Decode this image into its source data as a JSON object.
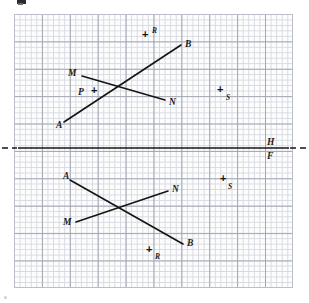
{
  "figure": {
    "background_color": "#ffffff",
    "grid_color": "#d3d7de",
    "grid_major_color": "#9aa0ad",
    "ink_color": "#141414",
    "width": 309,
    "height": 303
  },
  "grid": {
    "left": 14,
    "top": 14,
    "width": 279,
    "height": 274,
    "minor_cell_px": 5.58,
    "major_every": 5
  },
  "fold_line": {
    "name": "reference-line",
    "y": 148,
    "x_start": 18,
    "x_end": 289,
    "dash_left_x": 2,
    "dash_right_x": 307,
    "upper_label": "H",
    "lower_label": "F"
  },
  "top_view": {
    "name": "H-view",
    "lines": [
      {
        "name": "line-AB",
        "from_label": "A",
        "to_label": "B",
        "from": {
          "x": 64,
          "y": 122
        },
        "to": {
          "x": 181,
          "y": 45
        }
      },
      {
        "name": "line-MN",
        "from_label": "M",
        "to_label": "N",
        "from": {
          "x": 82,
          "y": 76
        },
        "to": {
          "x": 165,
          "y": 100
        }
      }
    ],
    "labels": [
      {
        "text": "A",
        "x": 56,
        "y": 121
      },
      {
        "text": "B",
        "x": 185,
        "y": 40
      },
      {
        "text": "M",
        "x": 68,
        "y": 69
      },
      {
        "text": "N",
        "x": 169,
        "y": 98
      }
    ],
    "points": [
      {
        "name": "point-P",
        "text": "P",
        "cross_x": 93,
        "cross_y": 87,
        "label_x": 78,
        "label_y": 88,
        "label_size": "lbl-lg"
      },
      {
        "name": "point-R",
        "text": "R",
        "cross_x": 144,
        "cross_y": 32,
        "label_x": 153,
        "label_y": 28,
        "label_size": "lbl-sm"
      },
      {
        "name": "point-S",
        "text": "S",
        "cross_x": 219,
        "cross_y": 88,
        "label_x": 227,
        "label_y": 95,
        "label_size": "lbl-sm"
      }
    ]
  },
  "bottom_view": {
    "name": "F-view",
    "lines": [
      {
        "name": "line-AB",
        "from_label": "A",
        "to_label": "B",
        "from": {
          "x": 70,
          "y": 180
        },
        "to": {
          "x": 183,
          "y": 244
        }
      },
      {
        "name": "line-MN",
        "from_label": "M",
        "to_label": "N",
        "from": {
          "x": 76,
          "y": 222
        },
        "to": {
          "x": 168,
          "y": 191
        }
      }
    ],
    "labels": [
      {
        "text": "A",
        "x": 64,
        "y": 173
      },
      {
        "text": "B",
        "x": 186,
        "y": 240
      },
      {
        "text": "M",
        "x": 64,
        "y": 219
      },
      {
        "text": "N",
        "x": 172,
        "y": 186
      }
    ],
    "points": [
      {
        "name": "point-R",
        "text": "R",
        "cross_x": 148,
        "cross_y": 247,
        "label_x": 155,
        "label_y": 254,
        "label_size": "lbl-sm"
      },
      {
        "name": "point-S",
        "text": "S",
        "cross_x": 222,
        "cross_y": 177,
        "label_x": 229,
        "label_y": 184,
        "label_size": "lbl-sm"
      }
    ]
  }
}
